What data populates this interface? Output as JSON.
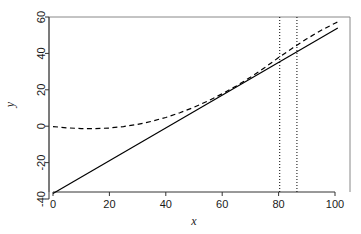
{
  "chart_data": {
    "type": "line",
    "title": "",
    "subtitle": "",
    "xlabel": "x",
    "ylabel": "y",
    "xlim": [
      -2,
      105
    ],
    "ylim": [
      -40,
      60
    ],
    "xticks": [
      0,
      20,
      40,
      60,
      80,
      100
    ],
    "xtick_labels": [
      "0",
      "20",
      "40",
      "60",
      "80",
      "100"
    ],
    "yticks": [
      -40,
      -20,
      0,
      20,
      40,
      60
    ],
    "ytick_labels": [
      "-40",
      "-20",
      "0",
      "20",
      "40",
      "60"
    ],
    "grid": false,
    "legend": "none",
    "box": "open-L",
    "series": [
      {
        "name": "solid-line",
        "style": "solid",
        "color": "#000000",
        "width": 1.2,
        "x": [
          0,
          101
        ],
        "y": [
          -37,
          54
        ]
      },
      {
        "name": "dashed-curve",
        "style": "dashed",
        "color": "#000000",
        "width": 1.2,
        "x": [
          0,
          5,
          10,
          15,
          20,
          25,
          30,
          35,
          40,
          45,
          50,
          55,
          60,
          65,
          70,
          75,
          80,
          85,
          90,
          95,
          100,
          101
        ],
        "y": [
          -0.2,
          -0.9,
          -1.3,
          -1.3,
          -1.0,
          -0.2,
          1.0,
          2.7,
          4.8,
          7.4,
          10.4,
          13.9,
          17.8,
          22.1,
          26.9,
          32.1,
          37.7,
          43.0,
          48.0,
          52.6,
          56.6,
          57.3
        ]
      }
    ],
    "vlines": [
      {
        "name": "vline-lower",
        "x": 80.4,
        "style": "dotted",
        "color": "#000000"
      },
      {
        "name": "vline-upper",
        "x": 86.5,
        "style": "dotted",
        "color": "#000000"
      }
    ]
  },
  "plot_geometry": {
    "px_left": 53,
    "px_right": 335,
    "px_top": 17,
    "px_bottom": 199,
    "frame_left": 49,
    "frame_right": 350,
    "frame_top": 17,
    "frame_bottom": 192
  }
}
